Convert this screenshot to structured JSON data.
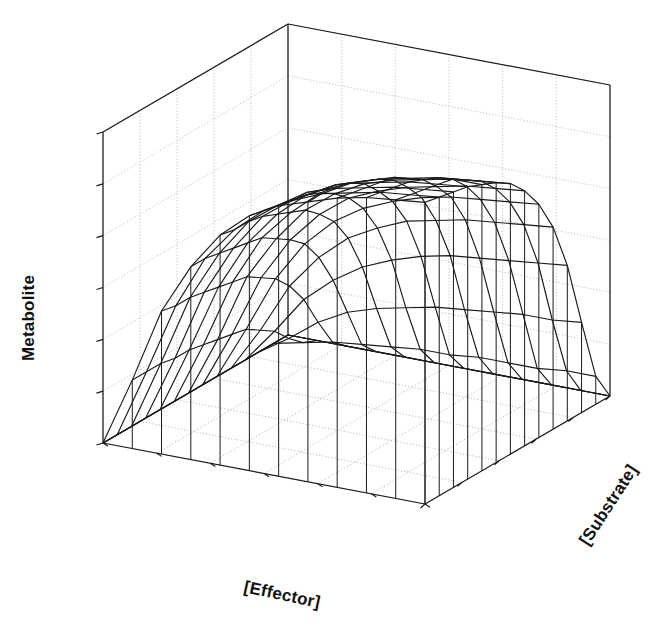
{
  "figure": {
    "type": "3d-surface-wireframe",
    "background_color": "#ffffff",
    "line_color": "#1a1a1a",
    "grid_color": "#9a9a9a",
    "width": 667,
    "height": 632
  },
  "axes": {
    "x": {
      "label": "[Effector]",
      "rotation_deg": 12,
      "tick_count": 5,
      "ticks_visible": true,
      "tick_labels": []
    },
    "y": {
      "label": "[Substrate]",
      "rotation_deg": -57,
      "tick_count": 6,
      "ticks_visible": true,
      "tick_labels": []
    },
    "z": {
      "label": "Metabolite",
      "rotation_deg": -90,
      "tick_count": 6,
      "ticks_visible": true,
      "tick_labels": []
    }
  },
  "chart_data": {
    "type": "surface",
    "title": "",
    "xlabel": "[Effector]",
    "ylabel": "[Substrate]",
    "zlabel": "Metabolite",
    "legend": null,
    "grid": true,
    "xlim": [
      0,
      1
    ],
    "ylim": [
      0,
      1
    ],
    "zlim": [
      0,
      1
    ],
    "nx": 14,
    "ny": 12,
    "surface_model": {
      "form": "z = zmax * (x^n / (k^n + x^n)) * (y^m / (j^m + y^m))",
      "zmax": 0.92,
      "n": 2.1,
      "k": 0.22,
      "m": 1.7,
      "j": 0.2
    },
    "x": [
      0.0,
      0.0769,
      0.1538,
      0.2308,
      0.3077,
      0.3846,
      0.4615,
      0.5385,
      0.6154,
      0.6923,
      0.7692,
      0.8462,
      0.9231,
      1.0
    ],
    "y": [
      0.0,
      0.0909,
      0.1818,
      0.2727,
      0.3636,
      0.4545,
      0.5455,
      0.6364,
      0.7273,
      0.8182,
      0.9091,
      1.0
    ],
    "z": [
      [
        0.0,
        0.0,
        0.0,
        0.0,
        0.0,
        0.0,
        0.0,
        0.0,
        0.0,
        0.0,
        0.0,
        0.0
      ],
      [
        0.0,
        0.02,
        0.04,
        0.05,
        0.06,
        0.07,
        0.07,
        0.08,
        0.08,
        0.08,
        0.09,
        0.09
      ],
      [
        0.0,
        0.06,
        0.13,
        0.18,
        0.21,
        0.23,
        0.25,
        0.26,
        0.27,
        0.28,
        0.28,
        0.29
      ],
      [
        0.0,
        0.11,
        0.23,
        0.31,
        0.37,
        0.41,
        0.44,
        0.46,
        0.47,
        0.48,
        0.49,
        0.5
      ],
      [
        0.0,
        0.14,
        0.3,
        0.41,
        0.49,
        0.54,
        0.58,
        0.6,
        0.62,
        0.63,
        0.64,
        0.65
      ],
      [
        0.0,
        0.17,
        0.35,
        0.48,
        0.57,
        0.63,
        0.67,
        0.7,
        0.72,
        0.73,
        0.74,
        0.75
      ],
      [
        0.0,
        0.18,
        0.38,
        0.52,
        0.62,
        0.69,
        0.73,
        0.76,
        0.78,
        0.8,
        0.81,
        0.82
      ],
      [
        0.0,
        0.19,
        0.41,
        0.55,
        0.66,
        0.73,
        0.78,
        0.81,
        0.83,
        0.85,
        0.86,
        0.87
      ],
      [
        0.0,
        0.2,
        0.42,
        0.58,
        0.68,
        0.76,
        0.81,
        0.84,
        0.86,
        0.88,
        0.89,
        0.9
      ],
      [
        0.0,
        0.21,
        0.43,
        0.59,
        0.7,
        0.78,
        0.83,
        0.86,
        0.89,
        0.9,
        0.92,
        0.92
      ],
      [
        0.0,
        0.21,
        0.44,
        0.6,
        0.72,
        0.79,
        0.84,
        0.88,
        0.9,
        0.92,
        0.93,
        0.94
      ],
      [
        0.0,
        0.22,
        0.45,
        0.61,
        0.73,
        0.8,
        0.86,
        0.89,
        0.91,
        0.93,
        0.94,
        0.95
      ],
      [
        0.0,
        0.22,
        0.45,
        0.62,
        0.73,
        0.81,
        0.86,
        0.9,
        0.92,
        0.94,
        0.95,
        0.96
      ],
      [
        0.0,
        0.22,
        0.46,
        0.62,
        0.74,
        0.82,
        0.87,
        0.9,
        0.93,
        0.95,
        0.96,
        0.97
      ]
    ]
  },
  "projection": {
    "origin_floor_back": [
      288,
      335
    ],
    "origin_floor_left": [
      103,
      443
    ],
    "origin_floor_front": [
      477,
      536
    ],
    "origin_floor_right": [
      610,
      396
    ],
    "wall_top_back": [
      288,
      24
    ],
    "wall_top_left": [
      103,
      131
    ],
    "wall_top_right": [
      611,
      36
    ],
    "z_axis_height_px": 312
  }
}
